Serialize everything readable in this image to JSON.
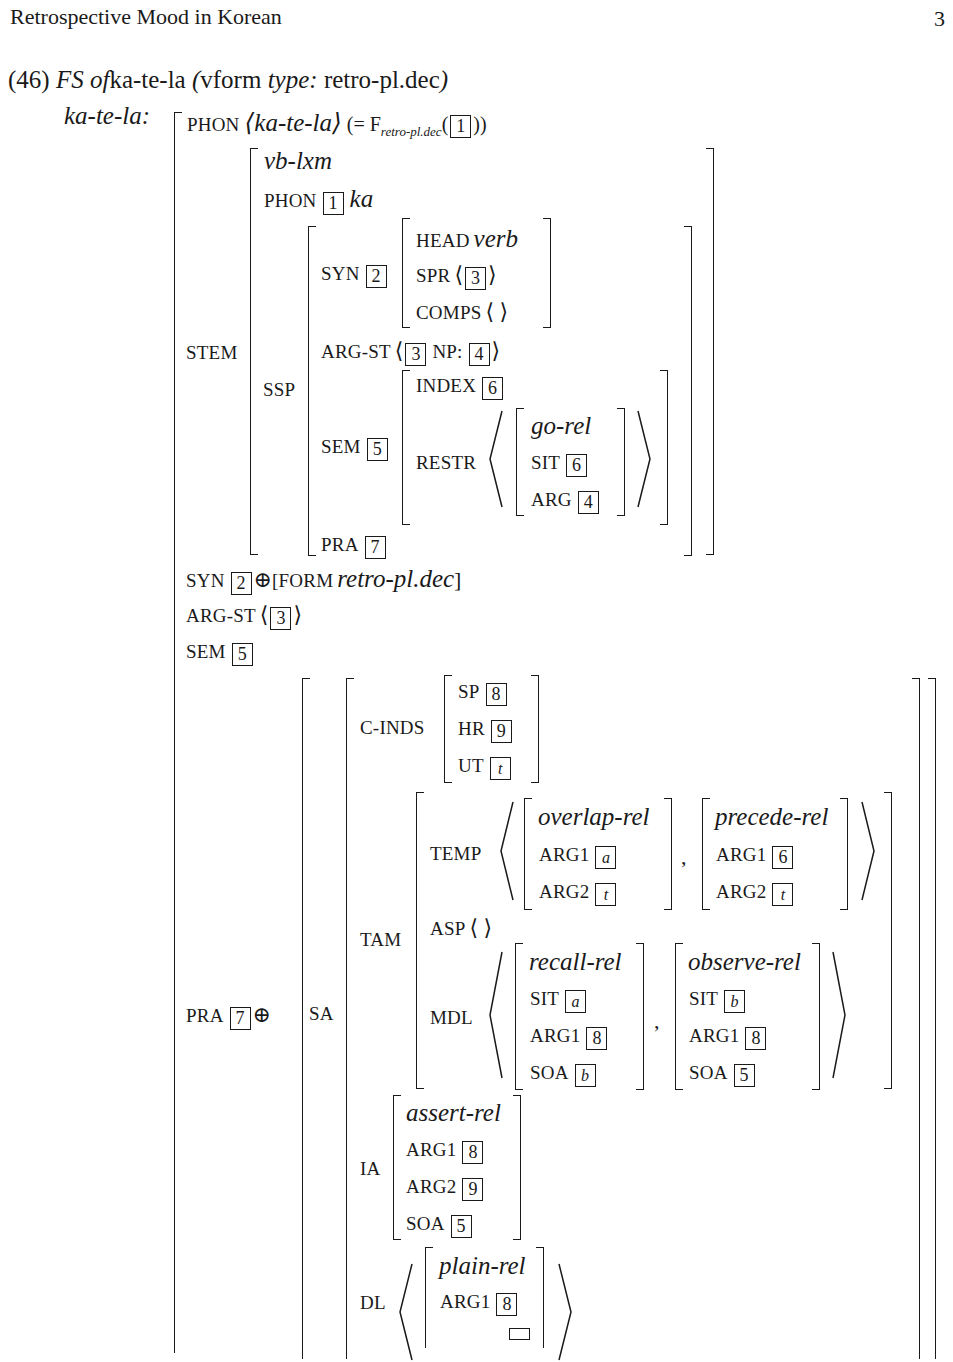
{
  "header": {
    "running_title": "Retrospective Mood in Korean",
    "page_number": "3"
  },
  "example": {
    "number": "(46)",
    "caption_fs": "FS of",
    "caption_word": "ka-te-la",
    "caption_paren_open": "(",
    "caption_vform": "vform",
    "caption_type": "type:",
    "caption_type_value": "retro-pl.dec",
    "caption_paren_close": ")",
    "word_label": "ka-te-la:"
  },
  "avm": {
    "phon": {
      "label": "PHON",
      "value": "⟨ka-te-la⟩",
      "eq": "(= F",
      "func_sub": "retro-pl.dec",
      "func_arg_tag": "1",
      "close": "))"
    },
    "stem": {
      "label": "STEM",
      "type": "vb-lxm",
      "phon_label": "PHON",
      "phon_tag": "1",
      "phon_value": "ka",
      "ssp": {
        "label": "SSP",
        "syn": {
          "label": "SYN",
          "tag": "2",
          "head_label": "HEAD",
          "head_value": "verb",
          "spr_label": "SPR",
          "spr_tag": "3",
          "comps_label": "COMPS",
          "comps_value": "⟨  ⟩"
        },
        "argst": {
          "label": "ARG-ST",
          "tag1": "3",
          "np_label": "NP:",
          "tag2": "4"
        },
        "sem": {
          "label": "SEM",
          "tag": "5",
          "index_label": "INDEX",
          "index_tag": "6",
          "restr_label": "RESTR",
          "rel_type": "go-rel",
          "sit_label": "SIT",
          "sit_tag": "6",
          "arg_label": "ARG",
          "arg_tag": "4"
        },
        "pra": {
          "label": "PRA",
          "tag": "7"
        }
      }
    },
    "syn": {
      "label": "SYN",
      "tag": "2",
      "oplus": "⊕",
      "form_open": "[FORM",
      "form_value": "retro-pl.dec",
      "form_close": "]"
    },
    "argst": {
      "label": "ARG-ST",
      "tag": "3"
    },
    "sem": {
      "label": "SEM",
      "tag": "5"
    },
    "pra": {
      "label": "PRA",
      "tag": "7",
      "oplus": "⊕",
      "sa": {
        "label": "SA",
        "c_inds": {
          "label": "C-INDS",
          "sp_label": "SP",
          "sp_tag": "8",
          "hr_label": "HR",
          "hr_tag": "9",
          "ut_label": "UT",
          "ut_tag": "t"
        },
        "tam": {
          "label": "TAM",
          "temp": {
            "label": "TEMP",
            "rel1": {
              "type": "overlap-rel",
              "arg1_label": "ARG1",
              "arg1_tag": "a",
              "arg2_label": "ARG2",
              "arg2_tag": "t"
            },
            "comma": ",",
            "rel2": {
              "type": "precede-rel",
              "arg1_label": "ARG1",
              "arg1_tag": "6",
              "arg2_label": "ARG2",
              "arg2_tag": "t"
            }
          },
          "asp": {
            "label": "ASP",
            "value": "⟨  ⟩"
          },
          "mdl": {
            "label": "MDL",
            "rel1": {
              "type": "recall-rel",
              "sit_label": "SIT",
              "sit_tag": "a",
              "arg1_label": "ARG1",
              "arg1_tag": "8",
              "soa_label": "SOA",
              "soa_tag": "b"
            },
            "comma": ",",
            "rel2": {
              "type": "observe-rel",
              "sit_label": "SIT",
              "sit_tag": "b",
              "arg1_label": "ARG1",
              "arg1_tag": "8",
              "soa_label": "SOA",
              "soa_tag": "5"
            }
          }
        },
        "ia": {
          "label": "IA",
          "type": "assert-rel",
          "arg1_label": "ARG1",
          "arg1_tag": "8",
          "arg2_label": "ARG2",
          "arg2_tag": "9",
          "soa_label": "SOA",
          "soa_tag": "5"
        },
        "dl": {
          "label": "DL",
          "type": "plain-rel",
          "arg1_label": "ARG1",
          "arg1_tag": "8"
        }
      }
    }
  }
}
